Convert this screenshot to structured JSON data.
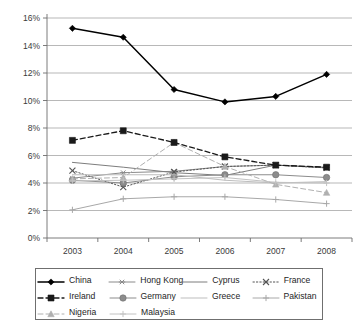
{
  "chart_data": {
    "type": "line",
    "title": "",
    "xlabel": "",
    "ylabel": "",
    "categories": [
      "2003",
      "2004",
      "2005",
      "2006",
      "2007",
      "2008"
    ],
    "ylim": [
      0,
      16
    ],
    "ytick_labels": [
      "0%",
      "2%",
      "4%",
      "6%",
      "8%",
      "10%",
      "12%",
      "14%",
      "16%"
    ],
    "ytick_values": [
      0,
      2,
      4,
      6,
      8,
      10,
      12,
      14,
      16
    ],
    "grid": true,
    "legend_position": "bottom",
    "series": [
      {
        "name": "China",
        "values": [
          15.25,
          14.6,
          10.8,
          9.9,
          10.3,
          11.9
        ],
        "color": "#000000",
        "marker": "diamond",
        "dash": "none",
        "width": 1.5
      },
      {
        "name": "Hong Kong",
        "values": [
          4.35,
          4.75,
          4.85,
          5.2,
          5.3,
          5.15
        ],
        "color": "#8a8a8a",
        "marker": "asterisk",
        "dash": "none",
        "width": 1.0
      },
      {
        "name": "Cyprus",
        "values": [
          5.5,
          5.15,
          4.75,
          4.55,
          5.3,
          5.1
        ],
        "color": "#7d7d7d",
        "marker": "none",
        "dash": "none",
        "width": 1.0
      },
      {
        "name": "France",
        "values": [
          4.9,
          3.7,
          4.8,
          5.2,
          5.3,
          5.1
        ],
        "color": "#555555",
        "marker": "cross",
        "dash": "dotted",
        "width": 1.0
      },
      {
        "name": "Ireland",
        "values": [
          7.1,
          7.8,
          6.95,
          5.9,
          5.3,
          5.15
        ],
        "color": "#1a1a1a",
        "marker": "square",
        "dash": "dashed",
        "width": 1.3
      },
      {
        "name": "Germany",
        "values": [
          4.2,
          4.0,
          4.45,
          4.6,
          4.6,
          4.4
        ],
        "color": "#8c8c8c",
        "marker": "circle",
        "dash": "none",
        "width": 1.0
      },
      {
        "name": "Greece",
        "values": [
          4.6,
          4.6,
          4.6,
          4.2,
          4.0,
          4.1
        ],
        "color": "#bdbdbd",
        "marker": "none",
        "dash": "none",
        "width": 1.0
      },
      {
        "name": "Pakistan",
        "values": [
          2.05,
          2.85,
          3.0,
          3.0,
          2.8,
          2.5
        ],
        "color": "#a8a8a8",
        "marker": "plus",
        "dash": "none",
        "width": 1.0
      },
      {
        "name": "Nigeria",
        "values": [
          4.3,
          4.4,
          6.95,
          5.2,
          3.9,
          3.3
        ],
        "color": "#b0b0b0",
        "marker": "triangle",
        "dash": "dashed",
        "width": 1.0
      },
      {
        "name": "Malaysia",
        "values": [
          4.15,
          4.2,
          4.3,
          4.4,
          4.05,
          4.0
        ],
        "color": "#c2c2c2",
        "marker": "plus",
        "dash": "none",
        "width": 1.0
      }
    ]
  },
  "legend": {
    "rows": [
      [
        "China",
        "Hong Kong",
        "Cyprus",
        "France"
      ],
      [
        "Ireland",
        "Germany",
        "Greece",
        "Pakistan"
      ],
      [
        "Nigeria",
        "Malaysia"
      ]
    ]
  }
}
